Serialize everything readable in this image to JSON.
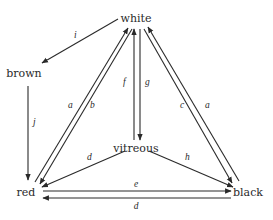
{
  "diagram": {
    "type": "state-transition",
    "nodes": {
      "white": {
        "label": "white",
        "x": 136,
        "y": 22
      },
      "brown": {
        "label": "brown",
        "x": 24,
        "y": 77
      },
      "vitreous": {
        "label": "vitreous",
        "x": 136,
        "y": 152
      },
      "red": {
        "label": "red",
        "x": 27,
        "y": 196
      },
      "black": {
        "label": "black",
        "x": 247,
        "y": 196
      }
    },
    "edges": [
      {
        "id": "i",
        "label": "i",
        "from": "white",
        "to": "brown"
      },
      {
        "id": "j",
        "label": "j",
        "from": "brown",
        "to": "red"
      },
      {
        "id": "a1",
        "label": "a",
        "from": "red",
        "to": "white"
      },
      {
        "id": "b",
        "label": "b",
        "from": "white",
        "to": "red"
      },
      {
        "id": "f",
        "label": "f",
        "from": "vitreous",
        "to": "white"
      },
      {
        "id": "g",
        "label": "g",
        "from": "white",
        "to": "vitreous"
      },
      {
        "id": "c",
        "label": "c",
        "from": "white",
        "to": "black"
      },
      {
        "id": "a2",
        "label": "a",
        "from": "black",
        "to": "white"
      },
      {
        "id": "d1",
        "label": "d",
        "from": "vitreous",
        "to": "red"
      },
      {
        "id": "h",
        "label": "h",
        "from": "vitreous",
        "to": "black"
      },
      {
        "id": "e",
        "label": "e",
        "from": "red",
        "to": "black"
      },
      {
        "id": "d2",
        "label": "d",
        "from": "black",
        "to": "red"
      }
    ],
    "colors": {
      "ink": "#2a2a2a",
      "background": "#ffffff"
    }
  }
}
